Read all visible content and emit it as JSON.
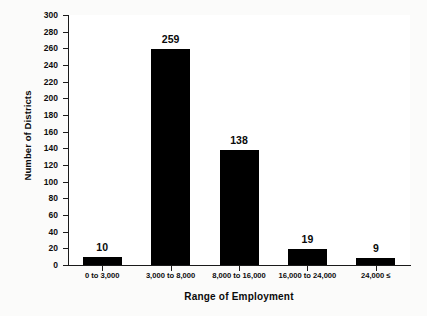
{
  "chart_data": {
    "type": "bar",
    "title": "",
    "xlabel": "Range of Employment",
    "ylabel": "Number of Districts",
    "categories": [
      "0 to 3,000",
      "3,000 to 8,000",
      "8,000 to 16,000",
      "16,000 to 24,000",
      "24,000 ≤"
    ],
    "values": [
      10,
      259,
      138,
      19,
      9
    ],
    "ylim": [
      0,
      300
    ],
    "ytick_step": 20,
    "yticks": [
      0,
      20,
      40,
      60,
      80,
      100,
      120,
      140,
      160,
      180,
      200,
      220,
      240,
      260,
      280,
      300
    ],
    "ytick_labels": [
      "0",
      "20",
      "40",
      "60",
      "80",
      "100",
      "120",
      "140",
      "160",
      "180",
      "200",
      "220",
      "240",
      "260",
      "280",
      "300"
    ],
    "grid": false,
    "legend": false,
    "legend_position": "none",
    "bar_color": "#000000",
    "plot_background": "#ffffff",
    "page_background": "#fbfbfa",
    "axis_color": "#1a1a1a",
    "value_labels_shown": true
  }
}
